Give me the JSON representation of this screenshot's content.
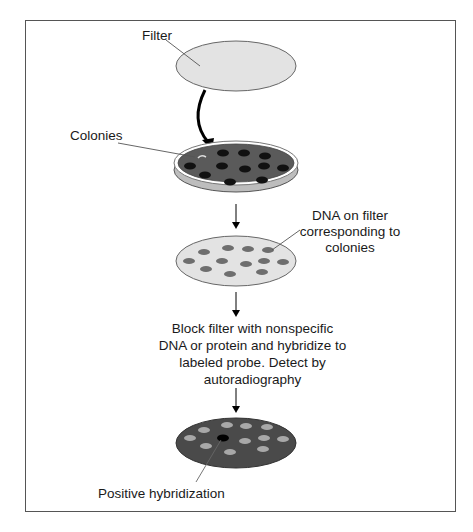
{
  "diagram": {
    "labels": {
      "filter": "Filter",
      "colonies": "Colonies",
      "dna_on_filter": [
        "DNA on filter",
        "corresponding to",
        "colonies"
      ],
      "step_text": [
        "Block filter with nonspecific",
        "DNA or protein and hybridize to",
        "labeled probe.  Detect by",
        "autoradiography"
      ],
      "positive": "Positive hybridization"
    },
    "colors": {
      "frame": "#555555",
      "filter_fill": "#e3e3e3",
      "dish_agar": "#5a5a5a",
      "dish_side": "#bdbdbd",
      "colony": "#111111",
      "dna_spot": "#6e6e6e",
      "autorad_bg": "#4a4a4a",
      "autorad_spot": "#a8a8a8",
      "positive_spot": "#000000"
    }
  }
}
